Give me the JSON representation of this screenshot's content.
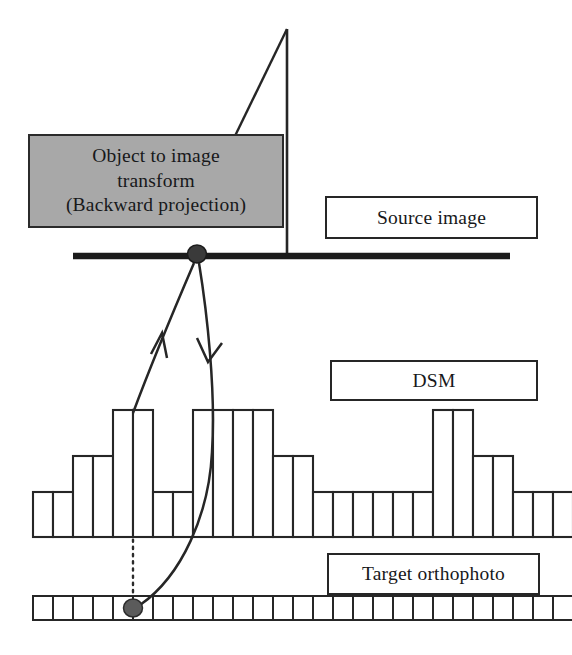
{
  "figure": {
    "background_color": "#ffffff",
    "stroke_color": "#262626",
    "box_fill_gray": "#a8a8a8"
  },
  "boxes": {
    "transform": {
      "line1": "Object to image",
      "line2": "transform",
      "line3": "(Backward projection)"
    },
    "source_image": {
      "label": "Source image"
    },
    "dsm": {
      "label": "DSM"
    },
    "target_orthophoto": {
      "label": "Target orthophoto"
    }
  },
  "chart_data": {
    "type": "bar",
    "title": "DSM",
    "xlabel": "",
    "ylabel": "",
    "grid": false,
    "legend": null,
    "baseline_y": 537,
    "bar_width": 20,
    "x_start": 33,
    "levels": {
      "low": 45,
      "mid": 81,
      "high": 127
    },
    "categories": [
      "1",
      "2",
      "3",
      "4",
      "5",
      "6",
      "7",
      "8",
      "9",
      "10",
      "11",
      "12",
      "13",
      "14",
      "15",
      "16",
      "17",
      "18",
      "19",
      "20",
      "21",
      "22",
      "23",
      "24",
      "25",
      "26",
      "27"
    ],
    "values": [
      45,
      45,
      81,
      81,
      127,
      127,
      45,
      45,
      127,
      127,
      127,
      127,
      81,
      81,
      45,
      45,
      45,
      45,
      45,
      45,
      127,
      127,
      81,
      81,
      45,
      45,
      45
    ]
  },
  "orthophoto_strip": {
    "cell_count": 27,
    "cell_width": 20,
    "x_start": 33,
    "top": 596,
    "height": 24,
    "marked_cell_index": 5
  },
  "annotations": {
    "camera_apex": {
      "x": 287,
      "y": 29
    },
    "perspective_center_node": {
      "x": 197,
      "y": 254,
      "radius": 9
    },
    "image_plane_line": {
      "x1": 73,
      "x2": 510,
      "y": 256,
      "thickness": 6
    },
    "ground_point_node": {
      "x": 133,
      "y": 608,
      "radius": 9
    },
    "arrow_up_label": "backward ray to image",
    "arrow_down_label": "projection to ground",
    "dotted_plumb_line": {
      "x": 133,
      "y1": 410,
      "y2": 600
    }
  }
}
